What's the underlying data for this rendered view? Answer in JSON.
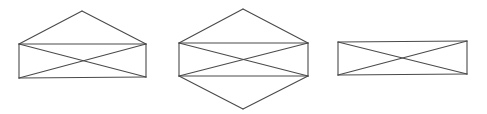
{
  "canvas": {
    "width": 487,
    "height": 114,
    "background": "#ffffff",
    "line_color": "#4a4a4a"
  },
  "figures": [
    {
      "name": "rectangle-with-top-triangle",
      "vertices": {
        "apex_top": [
          82,
          11
        ],
        "top_left": [
          19,
          44
        ],
        "top_right": [
          146,
          44
        ],
        "bottom_left": [
          19,
          78
        ],
        "bottom_right": [
          146,
          77
        ]
      },
      "edges": [
        [
          "top_left",
          "apex_top"
        ],
        [
          "apex_top",
          "top_right"
        ],
        [
          "top_left",
          "top_right"
        ],
        [
          "top_left",
          "bottom_left"
        ],
        [
          "top_right",
          "bottom_right"
        ],
        [
          "bottom_left",
          "bottom_right"
        ],
        [
          "top_left",
          "bottom_right"
        ],
        [
          "bottom_left",
          "top_right"
        ]
      ]
    },
    {
      "name": "rectangle-with-top-and-bottom-triangles",
      "vertices": {
        "apex_top": [
          243,
          9
        ],
        "top_left": [
          179,
          43
        ],
        "top_right": [
          308,
          43
        ],
        "bottom_left": [
          179,
          76
        ],
        "bottom_right": [
          308,
          76
        ],
        "apex_bottom": [
          243,
          109
        ]
      },
      "edges": [
        [
          "top_left",
          "apex_top"
        ],
        [
          "apex_top",
          "top_right"
        ],
        [
          "top_left",
          "top_right"
        ],
        [
          "top_left",
          "bottom_left"
        ],
        [
          "top_right",
          "bottom_right"
        ],
        [
          "bottom_left",
          "bottom_right"
        ],
        [
          "top_left",
          "bottom_right"
        ],
        [
          "bottom_left",
          "top_right"
        ],
        [
          "bottom_left",
          "apex_bottom"
        ],
        [
          "apex_bottom",
          "bottom_right"
        ]
      ]
    },
    {
      "name": "rectangle-with-diagonals",
      "vertices": {
        "top_left": [
          338,
          42
        ],
        "top_right": [
          467,
          41
        ],
        "bottom_left": [
          338,
          75
        ],
        "bottom_right": [
          467,
          74
        ]
      },
      "edges": [
        [
          "top_left",
          "top_right"
        ],
        [
          "top_left",
          "bottom_left"
        ],
        [
          "top_right",
          "bottom_right"
        ],
        [
          "bottom_left",
          "bottom_right"
        ],
        [
          "top_left",
          "bottom_right"
        ],
        [
          "bottom_left",
          "top_right"
        ]
      ]
    }
  ]
}
